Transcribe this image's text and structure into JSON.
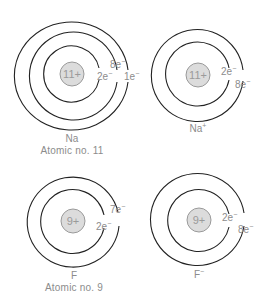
{
  "diagram": {
    "atoms": [
      {
        "id": "na",
        "symbol": "Na",
        "subtitle": "Atomic no. 11",
        "nucleus_charge": "11+",
        "shells": [
          {
            "label": "2e",
            "sup": "−"
          },
          {
            "label": "8e",
            "sup": "−"
          },
          {
            "label": "1e",
            "sup": "−"
          }
        ]
      },
      {
        "id": "na-ion",
        "symbol": "Na",
        "symbol_sup": "+",
        "nucleus_charge": "11+",
        "shells": [
          {
            "label": "2e",
            "sup": "−"
          },
          {
            "label": "8e",
            "sup": "−"
          }
        ]
      },
      {
        "id": "f",
        "symbol": "F",
        "subtitle": "Atomic no. 9",
        "nucleus_charge": "9+",
        "shells": [
          {
            "label": "2e",
            "sup": "−"
          },
          {
            "label": "7e",
            "sup": "−"
          }
        ]
      },
      {
        "id": "f-ion",
        "symbol": "F",
        "symbol_sup": "−",
        "nucleus_charge": "9+",
        "shells": [
          {
            "label": "2e",
            "sup": "−"
          },
          {
            "label": "8e",
            "sup": "−"
          }
        ]
      }
    ]
  },
  "colors": {
    "shell": "#222222",
    "nucleus_fill": "#dcdcdc",
    "label_text": "#8c8c8c"
  }
}
